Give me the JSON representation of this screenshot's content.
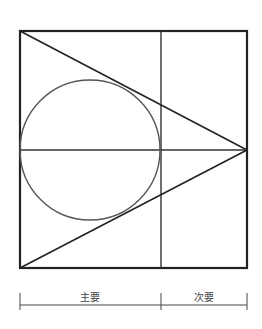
{
  "diagram": {
    "type": "composition-grid",
    "frame": {
      "x1": 20,
      "y1": 31,
      "x2": 247,
      "y2": 268
    },
    "divider_x": 161,
    "midline_y": 150,
    "circle": {
      "cx": 90,
      "cy": 150,
      "r": 70
    },
    "apex": {
      "x": 247,
      "y": 150
    },
    "stroke_color": "#222222",
    "circle_color": "#555555"
  },
  "dimension": {
    "y": 305,
    "ticks_x": [
      20,
      161,
      247
    ],
    "labels": [
      {
        "text": "主要",
        "x": 90
      },
      {
        "text": "次要",
        "x": 204
      }
    ]
  }
}
